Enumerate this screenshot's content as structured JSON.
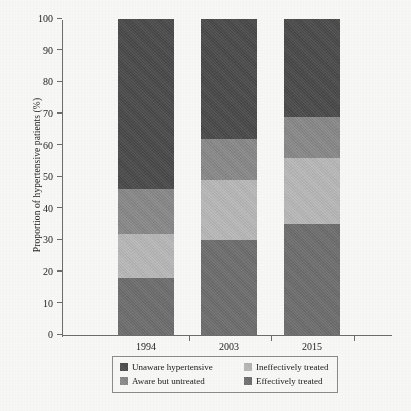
{
  "chart_data": {
    "type": "bar",
    "subtype": "stacked-bar-100",
    "title": "",
    "xlabel": "",
    "ylabel": "Proportion of hypertensive patients (%)",
    "categories": [
      "1994",
      "2003",
      "2015"
    ],
    "ylim": [
      0,
      100
    ],
    "yticks": [
      0,
      10,
      20,
      30,
      40,
      50,
      60,
      70,
      80,
      90,
      100
    ],
    "grid": false,
    "legend_position": "bottom",
    "stack_order_bottom_to_top": [
      "Effectively treated",
      "Ineffectively treated",
      "Aware but untreated",
      "Unaware hypertensive"
    ],
    "series": [
      {
        "name": "Unaware hypertensive",
        "color": "#4a4a4a",
        "values": [
          54,
          38,
          31
        ]
      },
      {
        "name": "Aware but untreated",
        "color": "#8b8b8b",
        "values": [
          14,
          13,
          13
        ]
      },
      {
        "name": "Ineffectively treated",
        "color": "#bcbcbc",
        "values": [
          14,
          19,
          21
        ]
      },
      {
        "name": "Effectively treated",
        "color": "#6f6f6f",
        "values": [
          18,
          30,
          35
        ]
      }
    ],
    "cumulative_tops": {
      "1994": {
        "Effectively treated": 18,
        "Ineffectively treated": 32,
        "Aware but untreated": 46,
        "Unaware hypertensive": 100
      },
      "2003": {
        "Effectively treated": 30,
        "Ineffectively treated": 49,
        "Aware but untreated": 62,
        "Unaware hypertensive": 100
      },
      "2015": {
        "Effectively treated": 35,
        "Ineffectively treated": 56,
        "Aware but untreated": 69,
        "Unaware hypertensive": 100
      }
    }
  },
  "legend": {
    "entries": [
      {
        "label": "Unaware hypertensive",
        "color": "#4a4a4a"
      },
      {
        "label": "Ineffectively treated",
        "color": "#bcbcbc"
      },
      {
        "label": "Aware but untreated",
        "color": "#8b8b8b"
      },
      {
        "label": "Effectively treated",
        "color": "#6f6f6f"
      }
    ]
  }
}
